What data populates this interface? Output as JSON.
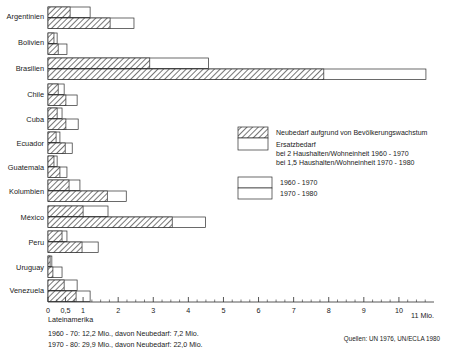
{
  "chart_data": {
    "type": "bar",
    "orientation": "horizontal",
    "title": "",
    "xlabel": "11 Mio.",
    "ylabel": "",
    "xlim": [
      0,
      11
    ],
    "grid": false,
    "axis_unit_label": "11 Mio.",
    "tick_labels": [
      "0",
      "0,5",
      "1",
      "2",
      "3",
      "4",
      "5",
      "6",
      "7",
      "8",
      "9",
      "10"
    ],
    "tick_values": [
      0,
      0.5,
      1,
      2,
      3,
      4,
      5,
      6,
      7,
      8,
      9,
      10
    ],
    "categories": [
      "Argentinien",
      "Bolivien",
      "Brasilien",
      "Chile",
      "Cuba",
      "Ecuador",
      "Guatemala",
      "Kolumbien",
      "México",
      "Peru",
      "Uruguay",
      "Venezuela"
    ],
    "series": [
      {
        "name": "1960 - 1970",
        "segments": [
          {
            "name": "Neubedarf aufgrund von Bevölkerungswachstum",
            "fill": "hatched"
          },
          {
            "name": "Ersatzbedarf",
            "fill": "white"
          }
        ],
        "neubedarf": [
          0.63,
          0.17,
          2.9,
          0.29,
          0.26,
          0.23,
          0.17,
          0.6,
          1.0,
          0.4,
          0.06,
          0.46
        ],
        "total": [
          1.2,
          0.26,
          4.57,
          0.46,
          0.4,
          0.34,
          0.26,
          0.91,
          1.71,
          0.54,
          0.11,
          0.83
        ]
      },
      {
        "name": "1970 - 1980",
        "segments": [
          {
            "name": "Neubedarf aufgrund von Bevölkerungswachstum",
            "fill": "hatched"
          },
          {
            "name": "Ersatzbedarf",
            "fill": "white"
          }
        ],
        "neubedarf": [
          1.77,
          0.29,
          7.86,
          0.51,
          0.51,
          0.49,
          0.34,
          1.69,
          3.54,
          0.97,
          0.14,
          0.8
        ],
        "total": [
          2.45,
          0.54,
          10.77,
          0.83,
          0.86,
          0.69,
          0.54,
          2.23,
          4.49,
          1.43,
          0.4,
          1.2
        ]
      }
    ]
  },
  "legend": {
    "hatched_label": "Neubedarf aufgrund von Bevölkerungswachstum",
    "white_label": "Ersatzbedarf",
    "white_sub1": "bei 2 Haushalten/Wohneinheit 1960 - 1970",
    "white_sub2": "bei 1,5 Haushalten/Wohneinheit 1970 - 1980",
    "period_top": "1960 - 1970",
    "period_bottom": "1970 - 1980"
  },
  "footer": {
    "region_label": "Lateinamerika",
    "note_line1": "1960 - 70: 12,2 Mio., davon Neubedarf: 7,2 Mio.",
    "note_line2": "1970 - 80: 29,9 Mio., davon Neubedarf: 22,0 Mio.",
    "source": "Quellen: UN 1976, UN/ECLA 1980"
  },
  "colors": {
    "ink": "#2b2b2b",
    "background": "#ffffff",
    "hatch": "#4a4a4a"
  }
}
